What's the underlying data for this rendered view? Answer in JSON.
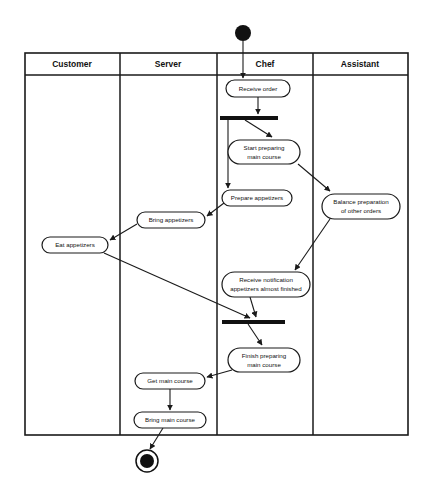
{
  "diagram": {
    "type": "uml-activity-diagram",
    "colors": {
      "background": "#ffffff",
      "stroke": "#1a1a1a",
      "fill": "#ffffff",
      "bar": "#111111",
      "text": "#111111"
    },
    "swimlanes": [
      {
        "id": "customer",
        "label": "Customer",
        "x": 25,
        "width": 95
      },
      {
        "id": "server",
        "label": "Server",
        "x": 120,
        "width": 97
      },
      {
        "id": "chef",
        "label": "Chef",
        "x": 217,
        "width": 96
      },
      {
        "id": "assistant",
        "label": "Assistant",
        "x": 313,
        "width": 95
      }
    ],
    "frame": {
      "x": 25,
      "y": 53,
      "width": 383,
      "height": 382,
      "header_height": 22
    },
    "nodes": [
      {
        "id": "start",
        "kind": "initial",
        "lane": "chef",
        "cx": 243,
        "cy": 33,
        "r": 8
      },
      {
        "id": "receive-order",
        "kind": "activity",
        "lane": "chef",
        "label": "Receive order",
        "x": 226,
        "y": 80,
        "width": 64,
        "height": 17
      },
      {
        "id": "fork",
        "kind": "fork-bar",
        "lane": "chef",
        "x": 220,
        "y": 116,
        "width": 58,
        "height": 4
      },
      {
        "id": "start-preparing-main-course",
        "kind": "activity",
        "lane": "chef",
        "label": "Start preparing\nmain course",
        "x": 228,
        "y": 140,
        "width": 72,
        "height": 24
      },
      {
        "id": "prepare-appetizers",
        "kind": "activity",
        "lane": "chef",
        "label": "Prepare appetizers",
        "x": 222,
        "y": 190,
        "width": 70,
        "height": 16
      },
      {
        "id": "balance-preparation",
        "kind": "activity",
        "lane": "assistant",
        "label": "Balance preparation\nof other orders",
        "x": 322,
        "y": 194,
        "width": 78,
        "height": 25
      },
      {
        "id": "bring-appetizers",
        "kind": "activity",
        "lane": "server",
        "label": "Bring appetizers",
        "x": 137,
        "y": 212,
        "width": 68,
        "height": 16
      },
      {
        "id": "eat-appetizers",
        "kind": "activity",
        "lane": "customer",
        "label": "Eat appetizers",
        "x": 42,
        "y": 237,
        "width": 66,
        "height": 16
      },
      {
        "id": "receive-notification",
        "kind": "activity",
        "lane": "chef",
        "label": "Receive notification\nappetizers almost finished",
        "x": 222,
        "y": 272,
        "width": 88,
        "height": 25
      },
      {
        "id": "join",
        "kind": "join-bar",
        "lane": "chef",
        "x": 222,
        "y": 320,
        "width": 63,
        "height": 4
      },
      {
        "id": "finish-preparing-main-course",
        "kind": "activity",
        "lane": "chef",
        "label": "Finish preparing\nmain course",
        "x": 228,
        "y": 348,
        "width": 72,
        "height": 24
      },
      {
        "id": "get-main-course",
        "kind": "activity",
        "lane": "server",
        "label": "Get main course",
        "x": 135,
        "y": 373,
        "width": 70,
        "height": 16
      },
      {
        "id": "bring-main-course",
        "kind": "activity",
        "lane": "server",
        "label": "Bring main course",
        "x": 134,
        "y": 412,
        "width": 72,
        "height": 16
      },
      {
        "id": "end",
        "kind": "final",
        "lane": "server",
        "cx": 147,
        "cy": 461,
        "r_outer": 11,
        "r_inner": 7
      }
    ],
    "edges": [
      {
        "id": "start-to-receive-order",
        "from": "start",
        "to": "receive-order"
      },
      {
        "id": "receive-order-to-fork",
        "from": "receive-order",
        "to": "fork"
      },
      {
        "id": "fork-to-start-preparing",
        "from": "fork",
        "to": "start-preparing-main-course"
      },
      {
        "id": "fork-to-prepare-appetizers",
        "from": "fork",
        "to": "prepare-appetizers"
      },
      {
        "id": "start-preparing-to-balance",
        "from": "start-preparing-main-course",
        "to": "balance-preparation"
      },
      {
        "id": "prepare-appetizers-to-bring-appetizers",
        "from": "prepare-appetizers",
        "to": "bring-appetizers"
      },
      {
        "id": "bring-appetizers-to-eat-appetizers",
        "from": "bring-appetizers",
        "to": "eat-appetizers"
      },
      {
        "id": "balance-to-receive-notification",
        "from": "balance-preparation",
        "to": "receive-notification"
      },
      {
        "id": "receive-notification-to-join",
        "from": "receive-notification",
        "to": "join"
      },
      {
        "id": "eat-appetizers-to-join",
        "from": "eat-appetizers",
        "to": "join"
      },
      {
        "id": "join-to-finish-preparing",
        "from": "join",
        "to": "finish-preparing-main-course"
      },
      {
        "id": "finish-preparing-to-get-main-course",
        "from": "finish-preparing-main-course",
        "to": "get-main-course"
      },
      {
        "id": "get-main-course-to-bring-main-course",
        "from": "get-main-course",
        "to": "bring-main-course"
      },
      {
        "id": "bring-main-course-to-end",
        "from": "bring-main-course",
        "to": "end"
      }
    ]
  }
}
